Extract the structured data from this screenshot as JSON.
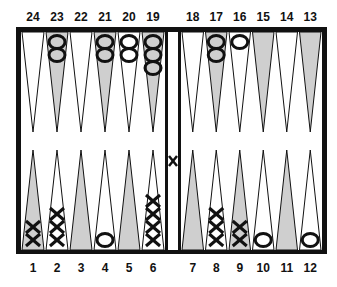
{
  "colors": {
    "frame": "#111111",
    "shaded_point": "#cfcfcf",
    "light_point": "#ffffff",
    "checker_stroke": "#111111"
  },
  "top_labels": [
    "24",
    "23",
    "22",
    "21",
    "20",
    "19",
    "18",
    "17",
    "16",
    "15",
    "14",
    "13"
  ],
  "bottom_labels": [
    "1",
    "2",
    "3",
    "4",
    "5",
    "6",
    "7",
    "8",
    "9",
    "10",
    "11",
    "12"
  ],
  "points": {
    "1": {
      "shaded": true,
      "checkers": {
        "type": "X",
        "count": 2
      }
    },
    "2": {
      "shaded": false,
      "checkers": {
        "type": "X",
        "count": 3
      }
    },
    "3": {
      "shaded": true,
      "checkers": {
        "type": "",
        "count": 0
      }
    },
    "4": {
      "shaded": false,
      "checkers": {
        "type": "O",
        "count": 1
      }
    },
    "5": {
      "shaded": true,
      "checkers": {
        "type": "",
        "count": 0
      }
    },
    "6": {
      "shaded": false,
      "checkers": {
        "type": "X",
        "count": 4
      }
    },
    "7": {
      "shaded": true,
      "checkers": {
        "type": "",
        "count": 0
      }
    },
    "8": {
      "shaded": false,
      "checkers": {
        "type": "X",
        "count": 3
      }
    },
    "9": {
      "shaded": true,
      "checkers": {
        "type": "X",
        "count": 2
      }
    },
    "10": {
      "shaded": false,
      "checkers": {
        "type": "O",
        "count": 1
      }
    },
    "11": {
      "shaded": true,
      "checkers": {
        "type": "",
        "count": 0
      }
    },
    "12": {
      "shaded": false,
      "checkers": {
        "type": "O",
        "count": 1
      }
    },
    "13": {
      "shaded": true,
      "checkers": {
        "type": "",
        "count": 0
      }
    },
    "14": {
      "shaded": false,
      "checkers": {
        "type": "",
        "count": 0
      }
    },
    "15": {
      "shaded": true,
      "checkers": {
        "type": "",
        "count": 0
      }
    },
    "16": {
      "shaded": false,
      "checkers": {
        "type": "O",
        "count": 1
      }
    },
    "17": {
      "shaded": true,
      "checkers": {
        "type": "O",
        "count": 2
      }
    },
    "18": {
      "shaded": false,
      "checkers": {
        "type": "",
        "count": 0
      }
    },
    "19": {
      "shaded": true,
      "checkers": {
        "type": "O",
        "count": 3
      }
    },
    "20": {
      "shaded": false,
      "checkers": {
        "type": "O",
        "count": 2
      }
    },
    "21": {
      "shaded": true,
      "checkers": {
        "type": "O",
        "count": 2
      }
    },
    "22": {
      "shaded": false,
      "checkers": {
        "type": "",
        "count": 0
      }
    },
    "23": {
      "shaded": true,
      "checkers": {
        "type": "O",
        "count": 2
      }
    },
    "24": {
      "shaded": false,
      "checkers": {
        "type": "",
        "count": 0
      }
    }
  },
  "bar": {
    "checkers": {
      "type": "X",
      "count": 1
    }
  }
}
